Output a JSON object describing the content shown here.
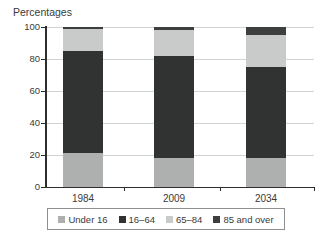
{
  "title": "Percentages",
  "chart_data": {
    "type": "bar",
    "stacked": true,
    "title": "Percentages",
    "categories": [
      "1984",
      "2009",
      "2034"
    ],
    "series": [
      {
        "name": "Under 16",
        "color": "#aeb0af",
        "values": [
          21,
          18,
          18
        ]
      },
      {
        "name": "16–64",
        "color": "#313333",
        "values": [
          64,
          64,
          57
        ]
      },
      {
        "name": "65–84",
        "color": "#c9cbca",
        "values": [
          14,
          16,
          20
        ]
      },
      {
        "name": "85 and over",
        "color": "#3d3f3f",
        "values": [
          1,
          2,
          5
        ]
      }
    ],
    "ylabel": "Percentages",
    "ylim": [
      0,
      100
    ],
    "yticks": [
      0,
      20,
      40,
      60,
      80,
      100
    ],
    "grid": true,
    "legend_position": "bottom",
    "colors": {
      "axis": "#2e2e2e",
      "grid": "#d2d4d3",
      "text": "#3a3a3a",
      "legend_border": "#8f8f8f",
      "background": "#ffffff"
    }
  }
}
